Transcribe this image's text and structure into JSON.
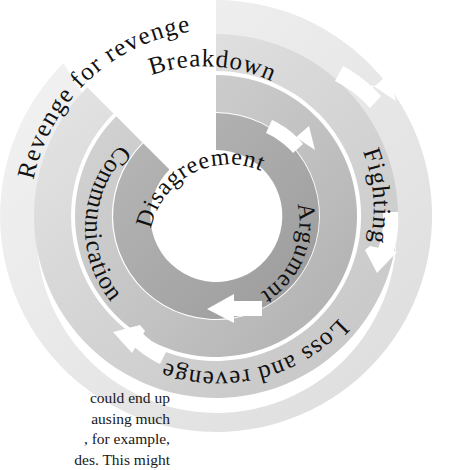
{
  "diagram": {
    "center_hole_color": "#ffffff",
    "rings": [
      {
        "id": "inner",
        "name": "disagreement-ring",
        "label": "Disagreement",
        "fill_light": "#b5b5b5",
        "fill_dark": "#9d9d9d",
        "arrow_color": "#ffffff",
        "arrows": 2
      },
      {
        "id": "middle-inner",
        "name": "argument-ring",
        "label": "Argument",
        "fill_light": "#b5b5b5",
        "fill_dark": "#9d9d9d",
        "arrow_color": "#ffffff",
        "arrows": 2
      },
      {
        "id": "middle",
        "name": "communication-ring",
        "label": "Communication",
        "fill_light": "#cfcfcf",
        "fill_dark": "#b2b2b2",
        "arrow_color": "#ffffff",
        "arrows": 2
      },
      {
        "id": "outer-upper",
        "name": "breakdown-ring",
        "label": "Breakdown",
        "fill_light": "#d8d8d8",
        "fill_dark": "#c4c4c4",
        "arrow_color": "#ffffff",
        "arrows": 1
      },
      {
        "id": "outer-right",
        "name": "fighting-ring",
        "label": "Fighting",
        "fill_light": "#dcdcdc",
        "fill_dark": "#c9c9c9",
        "arrow_color": "#ffffff",
        "arrows": 1
      },
      {
        "id": "outer-lower",
        "name": "loss-and-revenge-ring",
        "label": "Loss and revenge",
        "fill_light": "#e2e2e2",
        "fill_dark": "#d0d0d0",
        "arrow_color": "#ffffff",
        "arrows": 1
      },
      {
        "id": "outermost",
        "name": "revenge-for-revenge-ring",
        "label": "Revenge for revenge",
        "fill_light": "#efefef",
        "fill_dark": "#dedede",
        "arrow_color": "#ffffff",
        "arrows": 1
      }
    ],
    "labels": {
      "disagreement": "Disagreement",
      "argument": "Argument",
      "communication": "Communication",
      "breakdown": "Breakdown",
      "fighting": "Fighting",
      "loss_and_revenge": "Loss and revenge",
      "revenge_for_revenge": "Revenge for revenge"
    },
    "flow_direction": "clockwise",
    "arrow_count": 6
  },
  "body_text": {
    "lines": [
      "could end up",
      "ausing much",
      ", for example,",
      "des. This might"
    ]
  },
  "top_artifact": {
    "text": ""
  }
}
